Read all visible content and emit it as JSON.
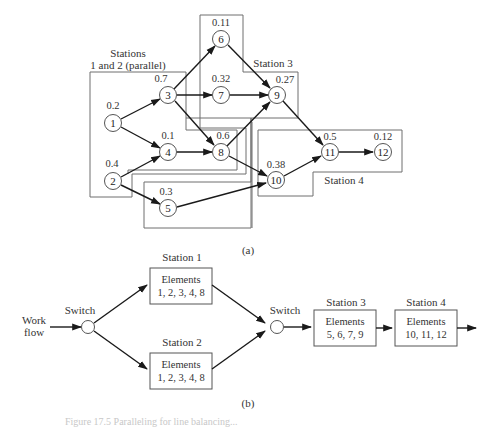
{
  "figure": {
    "part_a": {
      "caption": "(a)",
      "nodes": [
        {
          "id": "1",
          "time": "0.2"
        },
        {
          "id": "2",
          "time": "0.4"
        },
        {
          "id": "3",
          "time": "0.7"
        },
        {
          "id": "4",
          "time": "0.1"
        },
        {
          "id": "5",
          "time": "0.3"
        },
        {
          "id": "6",
          "time": "0.11"
        },
        {
          "id": "7",
          "time": "0.32"
        },
        {
          "id": "8",
          "time": "0.6"
        },
        {
          "id": "9",
          "time": "0.27"
        },
        {
          "id": "10",
          "time": "0.38"
        },
        {
          "id": "11",
          "time": "0.5"
        },
        {
          "id": "12",
          "time": "0.12"
        }
      ],
      "edges": [
        [
          "1",
          "3"
        ],
        [
          "1",
          "4"
        ],
        [
          "2",
          "4"
        ],
        [
          "2",
          "5"
        ],
        [
          "3",
          "6"
        ],
        [
          "3",
          "7"
        ],
        [
          "3",
          "8"
        ],
        [
          "4",
          "8"
        ],
        [
          "6",
          "9"
        ],
        [
          "7",
          "9"
        ],
        [
          "8",
          "9"
        ],
        [
          "8",
          "10"
        ],
        [
          "5",
          "10"
        ],
        [
          "9",
          "11"
        ],
        [
          "10",
          "11"
        ],
        [
          "11",
          "12"
        ]
      ],
      "station_labels": {
        "stations_12_line1": "Stations",
        "stations_12_line2": "1 and 2 (parallel)",
        "station_3": "Station 3",
        "station_4": "Station 4"
      }
    },
    "part_b": {
      "caption": "(b)",
      "input_label_line1": "Work",
      "input_label_line2": "flow",
      "switch_1_label": "Switch",
      "switch_2_label": "Switch",
      "stations": [
        {
          "title": "Station 1",
          "line1": "Elements",
          "line2": "1, 2, 3, 4, 8"
        },
        {
          "title": "Station 2",
          "line1": "Elements",
          "line2": "1, 2, 3, 4, 8"
        },
        {
          "title": "Station 3",
          "line1": "Elements",
          "line2": "5, 6, 7, 9"
        },
        {
          "title": "Station 4",
          "line1": "Elements",
          "line2": "10, 11, 12"
        }
      ]
    },
    "figure_caption_partial": "Figure 17.5 Paralleling for line balancing..."
  }
}
